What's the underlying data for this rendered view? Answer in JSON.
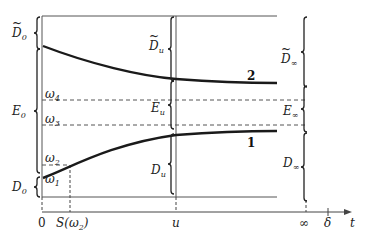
{
  "diagram": {
    "axis": {
      "ticks": [
        {
          "label": "0",
          "x": 42
        },
        {
          "label": "S(ω₂)",
          "x": 70,
          "base": "S(ω",
          "sub": "2",
          "tail": ")"
        },
        {
          "label": "u",
          "x": 174
        },
        {
          "label": "∞",
          "x": 306
        },
        {
          "label": "δ",
          "x": 328
        }
      ],
      "variable": "t"
    },
    "curves": [
      {
        "label": "1",
        "description": "increasing curve from D0/E0 boundary toward E∞/D∞ boundary"
      },
      {
        "label": "2",
        "description": "decreasing curve from D̃0/E0 boundary toward D̃∞/E∞ boundary"
      }
    ],
    "levels": [
      {
        "label": "ω4",
        "base": "ω",
        "sub": "4",
        "y": 100
      },
      {
        "label": "ω3",
        "base": "ω",
        "sub": "3",
        "y": 125
      },
      {
        "label": "ω2",
        "base": "ω",
        "sub": "2",
        "y": 165
      },
      {
        "label": "ω1",
        "base": "ω",
        "sub": "1",
        "y": 190
      }
    ],
    "braces": {
      "at_zero": [
        {
          "label": "D̃0",
          "base": "D",
          "sub": "0",
          "tilde": true
        },
        {
          "label": "E0",
          "base": "E",
          "sub": "0",
          "tilde": false
        },
        {
          "label": "D0",
          "base": "D",
          "sub": "0",
          "tilde": false
        }
      ],
      "at_u": [
        {
          "label": "D̃u",
          "base": "D",
          "sub": "u",
          "tilde": true
        },
        {
          "label": "Eu",
          "base": "E",
          "sub": "u",
          "tilde": false
        },
        {
          "label": "Du",
          "base": "D",
          "sub": "u",
          "tilde": false
        }
      ],
      "at_infinity": [
        {
          "label": "D̃∞",
          "base": "D",
          "sub": "∞",
          "tilde": true
        },
        {
          "label": "E∞",
          "base": "E",
          "sub": "∞",
          "tilde": false
        },
        {
          "label": "D∞",
          "base": "D",
          "sub": "∞",
          "tilde": false
        }
      ]
    },
    "colors": {
      "line": "#222222",
      "thin": "#555555",
      "background": "#ffffff"
    }
  }
}
